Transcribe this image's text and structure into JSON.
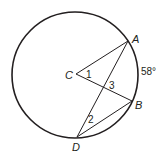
{
  "figure": {
    "type": "circle-geometry",
    "circle": {
      "center_label": "C",
      "cx": 75,
      "cy": 75,
      "r": 63
    },
    "points": {
      "A": {
        "label": "A",
        "x": 128,
        "y": 41
      },
      "B": {
        "label": "B",
        "x": 132,
        "y": 101
      },
      "C": {
        "label": "C",
        "x": 76,
        "y": 74
      },
      "D": {
        "label": "D",
        "x": 77,
        "y": 137
      }
    },
    "segments": [
      "CA",
      "CB",
      "AD",
      "BD"
    ],
    "angle_labels": {
      "angle1": "1",
      "angle2": "2",
      "angle3": "3"
    },
    "arc_label": "58°",
    "colors": {
      "stroke": "#231f20",
      "background": "#ffffff"
    }
  }
}
